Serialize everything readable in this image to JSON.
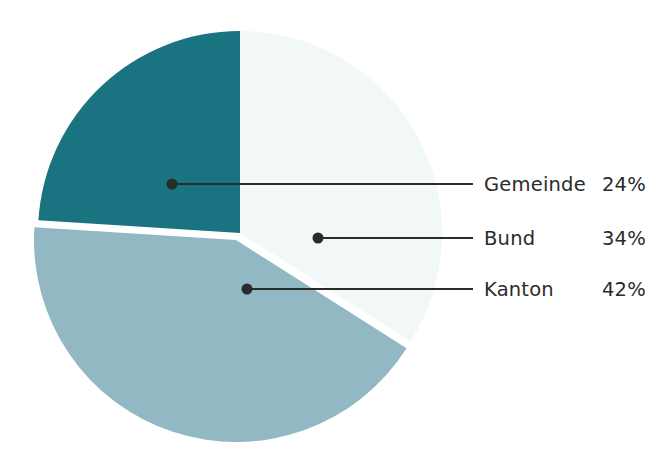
{
  "chart_data": {
    "type": "pie",
    "title": "",
    "subtitle": "",
    "xlabel": "",
    "ylabel": "",
    "legend_position": "right-callout",
    "grid": false,
    "value_suffix": "%",
    "start_angle_deg": 0,
    "direction": "clockwise",
    "categories": [
      "Gemeinde",
      "Bund",
      "Kanton"
    ],
    "values": [
      24,
      34,
      42
    ],
    "slices": [
      {
        "label": "Gemeinde",
        "value": 24,
        "value_text": "24%",
        "color": "#1a7380",
        "start_deg": 273.6,
        "end_deg": 360.0,
        "exploded": false,
        "callout_dot": {
          "x": 172,
          "y": 184
        },
        "callout_line_end_x": 473,
        "legend_row_y": 184
      },
      {
        "label": "Bund",
        "value": 34,
        "value_text": "34%",
        "color": "#f2f7f8",
        "start_deg": 0.0,
        "end_deg": 122.4,
        "exploded": false,
        "callout_dot": {
          "x": 318,
          "y": 238
        },
        "callout_line_end_x": 473,
        "legend_row_y": 238
      },
      {
        "label": "Kanton",
        "value": 42,
        "value_text": "42%",
        "color": "#92b8c4",
        "start_deg": 122.4,
        "end_deg": 273.6,
        "exploded": true,
        "callout_dot": {
          "x": 247,
          "y": 289
        },
        "callout_line_end_x": 473,
        "legend_row_y": 289
      }
    ],
    "geometry": {
      "center_x": 240,
      "center_y": 233,
      "radius": 202,
      "explode_offset_x": -4,
      "explode_offset_y": 7
    },
    "style": {
      "background": "#ffffff",
      "callout_color": "#2b2b2b",
      "text_color": "#2b2b2b",
      "label_x": 484,
      "value_x": 602
    }
  }
}
